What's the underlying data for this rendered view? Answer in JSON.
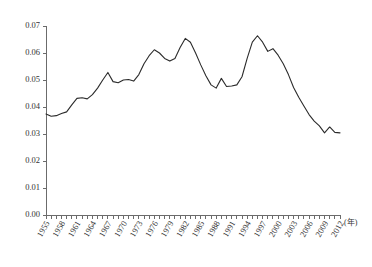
{
  "chart_data": {
    "type": "line",
    "title": "",
    "subtitle": "",
    "xlabel": "",
    "ylabel": "",
    "x_unit_label": "(年)",
    "grid": false,
    "legend": false,
    "legend_position": "none",
    "xlim": [
      1955,
      2012
    ],
    "ylim": [
      0.0,
      0.07
    ],
    "y_tick_step": 0.01,
    "x_tick_step": 1,
    "x_tick_label_step": 3,
    "y_ticks": [
      "0.00",
      "0.01",
      "0.02",
      "0.03",
      "0.04",
      "0.05",
      "0.06",
      "0.07"
    ],
    "y_tick_values": [
      0.0,
      0.01,
      0.02,
      0.03,
      0.04,
      0.05,
      0.06,
      0.07
    ],
    "x_tick_labels": [
      "1955",
      "1958",
      "1961",
      "1964",
      "1967",
      "1970",
      "1973",
      "1976",
      "1979",
      "1982",
      "1985",
      "1988",
      "1991",
      "1994",
      "1997",
      "2000",
      "2003",
      "2006",
      "2009",
      "2012"
    ],
    "x": [
      1955,
      1956,
      1957,
      1958,
      1959,
      1960,
      1961,
      1962,
      1963,
      1964,
      1965,
      1966,
      1967,
      1968,
      1969,
      1970,
      1971,
      1972,
      1973,
      1974,
      1975,
      1976,
      1977,
      1978,
      1979,
      1980,
      1981,
      1982,
      1983,
      1984,
      1985,
      1986,
      1987,
      1988,
      1989,
      1990,
      1991,
      1992,
      1993,
      1994,
      1995,
      1996,
      1997,
      1998,
      1999,
      2000,
      2001,
      2002,
      2003,
      2004,
      2005,
      2006,
      2007,
      2008,
      2009,
      2010,
      2011,
      2012
    ],
    "values": [
      0.0374,
      0.0366,
      0.0368,
      0.0376,
      0.0382,
      0.0408,
      0.0432,
      0.0434,
      0.043,
      0.0446,
      0.047,
      0.05,
      0.0528,
      0.0494,
      0.049,
      0.05,
      0.0502,
      0.0496,
      0.052,
      0.056,
      0.059,
      0.0612,
      0.06,
      0.058,
      0.057,
      0.058,
      0.062,
      0.0654,
      0.064,
      0.06,
      0.0556,
      0.0516,
      0.0482,
      0.047,
      0.0506,
      0.0476,
      0.0478,
      0.0482,
      0.0512,
      0.058,
      0.064,
      0.0664,
      0.064,
      0.0606,
      0.0616,
      0.0592,
      0.056,
      0.052,
      0.0472,
      0.0436,
      0.0404,
      0.0372,
      0.0348,
      0.033,
      0.0304,
      0.0326,
      0.0306,
      0.0304
    ],
    "series": [
      {
        "name": "series-1",
        "color": "#2b2b2b",
        "values": [
          0.0374,
          0.0366,
          0.0368,
          0.0376,
          0.0382,
          0.0408,
          0.0432,
          0.0434,
          0.043,
          0.0446,
          0.047,
          0.05,
          0.0528,
          0.0494,
          0.049,
          0.05,
          0.0502,
          0.0496,
          0.052,
          0.056,
          0.059,
          0.0612,
          0.06,
          0.058,
          0.057,
          0.058,
          0.062,
          0.0654,
          0.064,
          0.06,
          0.0556,
          0.0516,
          0.0482,
          0.047,
          0.0506,
          0.0476,
          0.0478,
          0.0482,
          0.0512,
          0.058,
          0.064,
          0.0664,
          0.064,
          0.0606,
          0.0616,
          0.0592,
          0.056,
          0.052,
          0.0472,
          0.0436,
          0.0404,
          0.0372,
          0.0348,
          0.033,
          0.0304,
          0.0326,
          0.0306,
          0.0304
        ]
      }
    ],
    "colors": {
      "line": "#2b2b2b",
      "axis": "#6b6b6b",
      "text": "#333333",
      "background": "#ffffff"
    }
  }
}
